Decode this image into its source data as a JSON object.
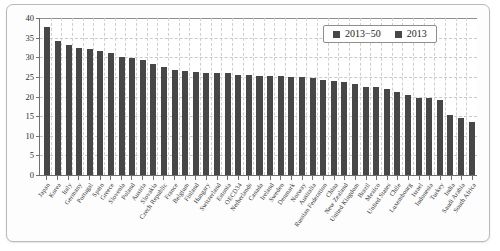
{
  "chart_data": {
    "type": "bar",
    "title": "",
    "xlabel": "",
    "ylabel": "",
    "ylim": [
      0,
      40
    ],
    "yticks": [
      0,
      5,
      10,
      15,
      20,
      25,
      30,
      35,
      40
    ],
    "grid": true,
    "legend_position": "top-right",
    "legend": [
      "2013−50",
      "2013"
    ],
    "categories": [
      "Japan",
      "Korea",
      "Italy",
      "Germany",
      "Portugal",
      "Spain",
      "Greece",
      "Slovenia",
      "Poland",
      "Austria",
      "Slovakia",
      "Czech Republic",
      "France",
      "Belgium",
      "Finland",
      "Hungary",
      "Switzerland",
      "Estonia",
      "OECD34",
      "Netherlands",
      "Canada",
      "Ireland",
      "Sweden",
      "Denmark",
      "Norway",
      "Australia",
      "Russian Federation",
      "China",
      "New Zealand",
      "United Kingdom",
      "Brazil",
      "Mexico",
      "United States",
      "Chile",
      "Luxembourg",
      "Israel",
      "Indonesia",
      "Turkey",
      "India",
      "Saudi Arabia",
      "South Africa"
    ],
    "series": [
      {
        "name": "2013−50",
        "values": [
          37.7,
          34.1,
          33.1,
          32.4,
          32.0,
          31.7,
          31.2,
          30.1,
          29.9,
          29.3,
          28.2,
          27.4,
          26.8,
          26.5,
          26.3,
          26.1,
          26.1,
          25.9,
          25.5,
          25.5,
          25.3,
          25.2,
          25.1,
          25.0,
          24.9,
          24.6,
          24.3,
          23.9,
          23.6,
          23.2,
          22.5,
          22.3,
          22.0,
          21.2,
          20.5,
          19.7,
          19.5,
          19.0,
          15.4,
          14.6,
          13.6
        ]
      }
    ]
  }
}
